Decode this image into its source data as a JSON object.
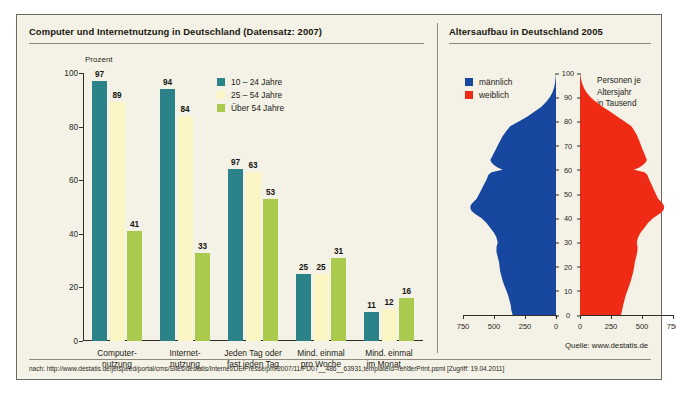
{
  "left_panel": {
    "title": "Computer und Internetnutzung in Deutschland (Datensatz: 2007)",
    "axis_label": "Prozent",
    "legend": [
      {
        "label": "10 – 24 Jahre",
        "color": "#2c8289"
      },
      {
        "label": "25 – 54 Jahre",
        "color": "#fbf6c4"
      },
      {
        "label": "Über 54 Jahre",
        "color": "#a9ca4d"
      }
    ]
  },
  "right_panel": {
    "title": "Altersaufbau in Deutschland 2005",
    "legend": [
      {
        "label": "männlich",
        "color": "#17479e"
      },
      {
        "label": "weiblich",
        "color": "#ef2b16"
      }
    ],
    "note": "Personen je\nAltersjahr\nin Tausend",
    "note_lines": [
      "Personen je",
      "Altersjahr",
      "in Tausend"
    ],
    "source": "Quelle: www.destatis.de"
  },
  "footer": {
    "text": "nach: http://www.destatis.de/jetspeed/portal/cms/Sites/destatis/Internet/DE/Presse/pm/2007/11/PD07__486__63931,templateId=renderPrint.psml [Zugriff: 19.04.2011]"
  },
  "chart_data": [
    {
      "type": "bar",
      "title": "Computer und Internetnutzung in Deutschland (Datensatz: 2007)",
      "xlabel": "",
      "ylabel": "Prozent",
      "ylim": [
        0,
        100
      ],
      "yticks": [
        0,
        20,
        40,
        60,
        80,
        100
      ],
      "grid": false,
      "legend_position": "top-center",
      "categories": [
        "Computer-\nnutzung",
        "Internet-\nnutzung",
        "Jeden Tag oder\nfast jeden Tag",
        "Mind. einmal\npro Woche",
        "Mind. einmal\nim Monat …"
      ],
      "category_lines": [
        [
          "Computer-",
          "nutzung"
        ],
        [
          "Internet-",
          "nutzung"
        ],
        [
          "Jeden Tag oder",
          "fast jeden Tag"
        ],
        [
          "Mind. einmal",
          "pro Woche"
        ],
        [
          "Mind. einmal",
          "im Monat …"
        ]
      ],
      "series": [
        {
          "name": "10 – 24 Jahre",
          "color": "#2c8289",
          "values": [
            97,
            94,
            64,
            25,
            11
          ],
          "labels": [
            "97",
            "94",
            "97",
            "25",
            "11"
          ]
        },
        {
          "name": "25 – 54 Jahre",
          "color": "#fbf6c4",
          "values": [
            89,
            84,
            63,
            25,
            12
          ],
          "labels": [
            "89",
            "84",
            "63",
            "25",
            "12"
          ]
        },
        {
          "name": "Über 54 Jahre",
          "color": "#a9ca4d",
          "values": [
            41,
            33,
            53,
            31,
            16
          ],
          "labels": [
            "41",
            "33",
            "53",
            "31",
            "16"
          ]
        }
      ]
    },
    {
      "type": "area",
      "title": "Altersaufbau in Deutschland 2005",
      "xlabel": "Personen je Altersjahr in Tausend",
      "ylabel": "Alter",
      "ylim": [
        0,
        100
      ],
      "yticks": [
        0,
        10,
        20,
        30,
        40,
        50,
        60,
        70,
        80,
        90,
        100
      ],
      "xlim": [
        0,
        750
      ],
      "xticks_left": [
        "750",
        "500",
        "250",
        "0"
      ],
      "xticks_right": [
        "0",
        "250",
        "500",
        "750"
      ],
      "grid": false,
      "legend_position": "top-left",
      "series": [
        {
          "name": "männlich",
          "color": "#17479e",
          "ages": [
            0,
            2,
            4,
            6,
            8,
            10,
            12,
            14,
            16,
            18,
            20,
            22,
            24,
            26,
            28,
            30,
            32,
            34,
            36,
            38,
            40,
            41,
            42,
            43,
            44,
            45,
            46,
            47,
            48,
            50,
            52,
            54,
            56,
            58,
            59,
            60,
            61,
            62,
            63,
            64,
            65,
            66,
            67,
            68,
            70,
            72,
            74,
            76,
            78,
            80,
            82,
            84,
            86,
            88,
            90,
            92,
            94,
            96,
            98,
            100
          ],
          "values": [
            350,
            360,
            365,
            375,
            385,
            400,
            415,
            430,
            440,
            450,
            455,
            460,
            470,
            480,
            480,
            470,
            480,
            500,
            530,
            560,
            600,
            630,
            660,
            680,
            690,
            690,
            680,
            660,
            640,
            620,
            600,
            580,
            560,
            545,
            520,
            430,
            470,
            500,
            520,
            530,
            520,
            510,
            500,
            490,
            470,
            450,
            430,
            400,
            370,
            300,
            230,
            175,
            120,
            80,
            50,
            28,
            15,
            8,
            3,
            0
          ]
        },
        {
          "name": "weiblich",
          "color": "#ef2b16",
          "ages": [
            0,
            2,
            4,
            6,
            8,
            10,
            12,
            14,
            16,
            18,
            20,
            22,
            24,
            26,
            28,
            30,
            32,
            34,
            36,
            38,
            40,
            41,
            42,
            43,
            44,
            45,
            46,
            47,
            48,
            50,
            52,
            54,
            56,
            58,
            59,
            60,
            61,
            62,
            63,
            64,
            65,
            66,
            67,
            68,
            70,
            72,
            74,
            76,
            78,
            80,
            82,
            84,
            86,
            88,
            90,
            92,
            94,
            96,
            98,
            100
          ],
          "values": [
            330,
            340,
            348,
            358,
            368,
            382,
            396,
            410,
            420,
            430,
            437,
            443,
            453,
            462,
            464,
            458,
            468,
            488,
            518,
            548,
            588,
            618,
            648,
            668,
            678,
            678,
            668,
            650,
            630,
            612,
            594,
            576,
            558,
            543,
            520,
            435,
            478,
            508,
            528,
            540,
            532,
            524,
            516,
            508,
            492,
            478,
            462,
            440,
            415,
            360,
            300,
            245,
            185,
            130,
            85,
            52,
            30,
            15,
            6,
            0
          ]
        }
      ]
    }
  ]
}
